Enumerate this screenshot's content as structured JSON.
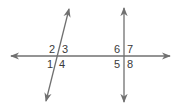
{
  "diagram": {
    "type": "transversal-lines",
    "line_color": "#707070",
    "label_color": "#3a3a3a",
    "lines": [
      {
        "name": "horizontal-line",
        "x1": 11,
        "y1": 56,
        "x2": 170,
        "y2": 56
      },
      {
        "name": "slanted-transversal",
        "x1": 69,
        "y1": 9,
        "x2": 46,
        "y2": 101
      },
      {
        "name": "vertical-transversal",
        "x1": 124,
        "y1": 8,
        "x2": 124,
        "y2": 102
      }
    ],
    "angle_labels": [
      {
        "id": "1",
        "text": "1",
        "x": 47,
        "y": 68
      },
      {
        "id": "2",
        "text": "2",
        "x": 49,
        "y": 53
      },
      {
        "id": "3",
        "text": "3",
        "x": 62,
        "y": 53
      },
      {
        "id": "4",
        "text": "4",
        "x": 59,
        "y": 68
      },
      {
        "id": "5",
        "text": "5",
        "x": 114,
        "y": 68
      },
      {
        "id": "6",
        "text": "6",
        "x": 114,
        "y": 53
      },
      {
        "id": "7",
        "text": "7",
        "x": 127,
        "y": 53
      },
      {
        "id": "8",
        "text": "8",
        "x": 127,
        "y": 68
      }
    ]
  }
}
